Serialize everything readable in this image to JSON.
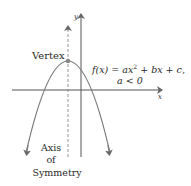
{
  "diagram": {
    "axes": {
      "x_label": "x",
      "y_label": "y"
    },
    "vertex_label": "Vertex",
    "equation_line1_prefix": "f(x) = ax",
    "equation_exponent": "2",
    "equation_line1_suffix": " + bx + c,",
    "equation_line2": "a < 0",
    "axis_of_symmetry_label": [
      "Axis",
      "of",
      "Symmetry"
    ],
    "colors": {
      "curve": "#7a7a7a",
      "axes": "#555555",
      "vertex_dot": "#8a8a8a",
      "text": "#2a2a2a"
    }
  }
}
